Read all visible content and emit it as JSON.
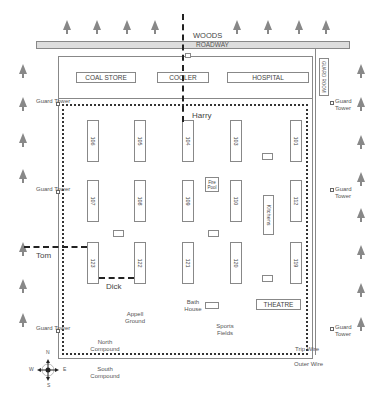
{
  "map": {
    "woods": "WOODS",
    "roadway": "ROADWAY",
    "guard_room": "GUARD ROOM",
    "buildings": {
      "coal_store": "COAL STORE",
      "cooler": "COOLER",
      "hospital": "HOSPITAL",
      "fire_pool": "Fire Pool",
      "kitchens": "Kitchens",
      "theatre": "THEATRE",
      "bath_house": "Bath House"
    },
    "huts": {
      "row1": [
        "106",
        "105",
        "104",
        "103",
        "101"
      ],
      "row2": [
        "107",
        "108",
        "109",
        "110",
        "112"
      ],
      "row3": [
        "123",
        "122",
        "121",
        "120",
        "119"
      ]
    },
    "areas": {
      "appell_ground": "Appell Ground",
      "sports_fields": "Sports Fields",
      "north_compound": "North Compound",
      "south_compound": "South Compound"
    },
    "guard_tower": "Guard Tower",
    "trip_wire": "Trip Wire",
    "outer_wire": "Outer Wire",
    "tunnels": {
      "harry": "Harry",
      "tom": "Tom",
      "dick": "Dick"
    },
    "compass": {
      "n": "N",
      "s": "S",
      "e": "E",
      "w": "W"
    }
  }
}
